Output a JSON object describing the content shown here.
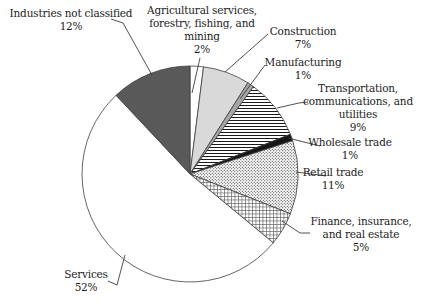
{
  "chart_data": {
    "type": "pie",
    "title": "",
    "unit": "percent",
    "direction": "clockwise",
    "start_angle_deg": 0,
    "legend_position": "none",
    "slices": [
      {
        "id": "agriculture",
        "label": "Agricultural services,\nforestry, fishing, and\nmining",
        "pct": "2%",
        "value": 2,
        "fill": "white"
      },
      {
        "id": "construction",
        "label": "Construction",
        "pct": "7%",
        "value": 7,
        "fill": "light_gray"
      },
      {
        "id": "manufacturing",
        "label": "Manufacturing",
        "pct": "1%",
        "value": 1,
        "fill": "mid_gray"
      },
      {
        "id": "transportation",
        "label": "Transportation,\ncommunications, and\nutilities",
        "pct": "9%",
        "value": 9,
        "fill": "hlines"
      },
      {
        "id": "wholesale",
        "label": "Wholesale trade",
        "pct": "1%",
        "value": 1,
        "fill": "black"
      },
      {
        "id": "retail",
        "label": "Retail trade",
        "pct": "11%",
        "value": 11,
        "fill": "dots"
      },
      {
        "id": "finance",
        "label": "Finance, insurance,\nand real estate",
        "pct": "5%",
        "value": 5,
        "fill": "grid"
      },
      {
        "id": "services",
        "label": "Services",
        "pct": "52%",
        "value": 52,
        "fill": "white"
      },
      {
        "id": "not_classified",
        "label": "Industries not classified",
        "pct": "12%",
        "value": 12,
        "fill": "dark_gray"
      }
    ],
    "colors": {
      "white": "#ffffff",
      "light_gray": "#d9d9d9",
      "mid_gray": "#a6a6a6",
      "dark_gray": "#595959",
      "black": "#161616",
      "stroke": "#3d3d3d",
      "pattern_ink": "#1a1a1a"
    }
  }
}
